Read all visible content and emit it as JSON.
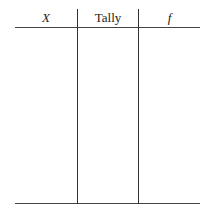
{
  "table": {
    "columns": [
      {
        "label": "X",
        "italic": true
      },
      {
        "label": "Tally",
        "italic": false
      },
      {
        "label": "f",
        "italic": true
      }
    ],
    "rows": []
  }
}
